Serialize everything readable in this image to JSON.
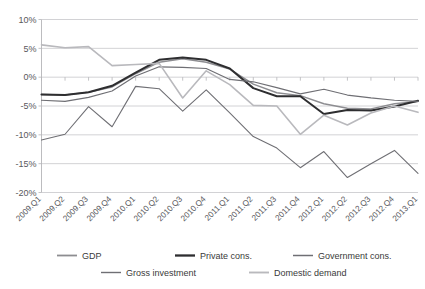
{
  "figure": {
    "caption_sliver": "",
    "background": "#ffffff"
  },
  "chart_data": {
    "type": "line",
    "title": "",
    "subtitle": "",
    "xlabel": "",
    "ylabel": "",
    "ylim": [
      -20,
      10
    ],
    "ytick_labels": [
      "10%",
      "5%",
      "0%",
      "-5%",
      "-10%",
      "-15%",
      "-20%"
    ],
    "ytick_values": [
      10,
      5,
      0,
      -5,
      -10,
      -15,
      -20
    ],
    "y_unit": "%",
    "grid": true,
    "grid_axis": "y",
    "legend_position": "bottom",
    "categories": [
      "2009.Q1",
      "2009.Q2",
      "2009.Q3",
      "2009.Q4",
      "2010.Q1",
      "2010.Q2",
      "2010.Q3",
      "2010.Q4",
      "2011.Q1",
      "2011.Q2",
      "2011.Q3",
      "2011.Q4",
      "2012.Q1",
      "2012.Q2",
      "2012.Q3",
      "2012.Q4",
      "2013.Q1"
    ],
    "series": [
      {
        "name": "GDP",
        "color": "#8d8d91",
        "width": 1.5,
        "values": [
          -3.0,
          -3.1,
          -2.6,
          -1.7,
          0.6,
          2.6,
          3.2,
          2.6,
          1.4,
          -1.2,
          -2.7,
          -3.2,
          -4.6,
          -5.4,
          -5.5,
          -4.6,
          -4.2
        ]
      },
      {
        "name": "Private cons.",
        "color": "#2e2e30",
        "width": 2.0,
        "values": [
          -3.0,
          -3.1,
          -2.6,
          -1.5,
          0.8,
          3.0,
          3.4,
          3.0,
          1.5,
          -1.9,
          -3.3,
          -3.3,
          -6.4,
          -5.7,
          -5.8,
          -5.1,
          -4.1
        ]
      },
      {
        "name": "Government cons.",
        "color": "#6f6f74",
        "width": 1.2,
        "values": [
          -4.0,
          -4.2,
          -3.5,
          -2.4,
          0.2,
          1.8,
          1.7,
          1.5,
          -0.4,
          -0.8,
          -1.8,
          -2.9,
          -2.1,
          -3.1,
          -3.6,
          -4.0,
          -4.2
        ]
      },
      {
        "name": "Gross investment",
        "color": "#6f6f74",
        "width": 1.1,
        "values": [
          -10.9,
          -9.9,
          -5.1,
          -8.6,
          -1.6,
          -2.0,
          -5.9,
          -2.2,
          -6.2,
          -10.3,
          -12.3,
          -15.7,
          -12.9,
          -17.4,
          -15.0,
          -12.7,
          -16.7
        ]
      },
      {
        "name": "Domestic demand",
        "color": "#b9b9bd",
        "width": 1.6,
        "values": [
          5.6,
          5.1,
          5.3,
          2.0,
          2.2,
          2.4,
          -3.6,
          1.1,
          -1.3,
          -4.9,
          -5.0,
          -9.9,
          -6.6,
          -8.3,
          -6.2,
          -5.0,
          -6.1
        ]
      }
    ]
  },
  "legend": {
    "entries": [
      {
        "label": "GDP",
        "color": "#8d8d91"
      },
      {
        "label": "Private cons.",
        "color": "#2e2e30"
      },
      {
        "label": "Government cons.",
        "color": "#6f6f74"
      },
      {
        "label": "Gross investment",
        "color": "#6f6f74"
      },
      {
        "label": "Domestic demand",
        "color": "#b9b9bd"
      }
    ]
  }
}
